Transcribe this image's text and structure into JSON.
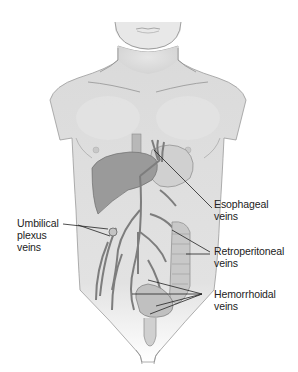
{
  "figure": {
    "colors": {
      "skin": "#dcdcdc",
      "skin_outline": "#8a8a8a",
      "organ": "#9a9a9a",
      "organ_light": "#c4c4c4",
      "vein": "#7d7d7d",
      "leader_line": "#222222",
      "text": "#222222"
    }
  },
  "labels": {
    "esophageal": {
      "line1": "Esophageal",
      "line2": "veins"
    },
    "umbilical": {
      "line1": "Umbilical",
      "line2": "plexus",
      "line3": "veins"
    },
    "retroperitoneal": {
      "line1": "Retroperitoneal",
      "line2": "veins"
    },
    "hemorrhoidal": {
      "line1": "Hemorrhoidal",
      "line2": "veins"
    }
  }
}
